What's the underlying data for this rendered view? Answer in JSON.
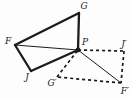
{
  "diagram": {
    "background": "#fdfdfd",
    "line_color": "#1c1c1c",
    "label_color": "#1c1c1c",
    "points": {
      "F": {
        "x": 15,
        "y": 45,
        "label": "F",
        "label_x": 8,
        "label_y": 41,
        "dot": false
      },
      "G": {
        "x": 79,
        "y": 13,
        "label": "G",
        "label_x": 84,
        "label_y": 6,
        "dot": false
      },
      "P": {
        "x": 78,
        "y": 50,
        "label": "P",
        "label_x": 85,
        "label_y": 42,
        "dot": true
      },
      "J": {
        "x": 31,
        "y": 71,
        "label": "J",
        "label_x": 27,
        "label_y": 77,
        "dot": false
      },
      "Gp": {
        "x": 57,
        "y": 77,
        "label": "G′",
        "label_x": 52,
        "label_y": 83,
        "dot": false
      },
      "Jp": {
        "x": 124,
        "y": 51,
        "label": "J′",
        "label_x": 124,
        "label_y": 44,
        "dot": false
      },
      "Fp": {
        "x": 121,
        "y": 83,
        "label": "F′",
        "label_x": 125,
        "label_y": 91,
        "dot": false
      }
    },
    "edges": [
      {
        "from": "F",
        "to": "G",
        "style": "thick"
      },
      {
        "from": "G",
        "to": "P",
        "style": "thick"
      },
      {
        "from": "P",
        "to": "J",
        "style": "thick"
      },
      {
        "from": "J",
        "to": "F",
        "style": "thick"
      },
      {
        "from": "F",
        "to": "P",
        "style": "thin"
      },
      {
        "from": "P",
        "to": "Jp",
        "style": "dashed"
      },
      {
        "from": "Jp",
        "to": "Fp",
        "style": "dashed"
      },
      {
        "from": "Fp",
        "to": "Gp",
        "style": "dashed"
      },
      {
        "from": "Gp",
        "to": "P",
        "style": "dashed"
      },
      {
        "from": "P",
        "to": "Fp",
        "style": "thin"
      }
    ],
    "dot_radius": 2.4
  }
}
